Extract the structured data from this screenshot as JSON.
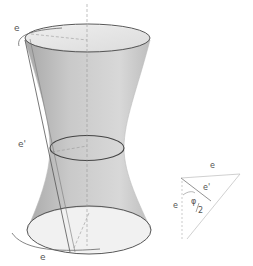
{
  "diagram": {
    "colors": {
      "surface_fill": "#c8c8c8",
      "surface_light": "#e4e4e4",
      "outline": "#555555",
      "axis": "#999999",
      "line": "#777777"
    },
    "labels": {
      "top_e": "e",
      "waist_e_prime": "e'",
      "bottom_e": "e"
    },
    "inset": {
      "label_e_top": "e",
      "label_e_prime": "e'",
      "label_e_left": "e",
      "angle_label": "φ/2",
      "angle_num": "φ",
      "angle_den": "2"
    }
  }
}
